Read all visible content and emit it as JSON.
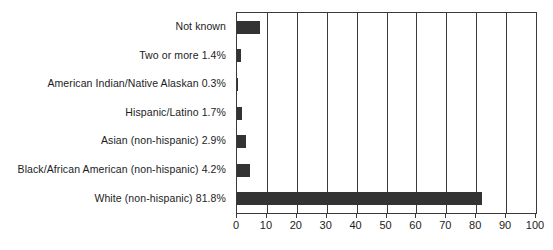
{
  "chart_data": {
    "type": "bar",
    "orientation": "horizontal",
    "title": "",
    "subtitle": "",
    "xlabel": "",
    "ylabel": "",
    "xlim": [
      0,
      100
    ],
    "xticks": [
      0,
      10,
      20,
      30,
      40,
      50,
      60,
      70,
      80,
      90,
      100
    ],
    "xtick_labels": [
      "0",
      "10",
      "20",
      "30",
      "40",
      "50",
      "60",
      "70",
      "80",
      "90",
      "100"
    ],
    "grid": true,
    "grid_axis": "x",
    "legend": false,
    "legend_position": "none",
    "bar_color": "#333333",
    "axis_color": "#3a3a3a",
    "categories": [
      "Not known",
      "Two or more 1.4%",
      "American Indian/Native Alaskan 0.3%",
      "Hispanic/Latino 1.7%",
      "Asian (non-hispanic) 2.9%",
      "Black/African American (non-hispanic) 4.2%",
      "White (non-hispanic) 81.8%"
    ],
    "values": [
      7.7,
      1.4,
      0.3,
      1.7,
      2.9,
      4.2,
      81.8
    ],
    "bars": [
      {
        "label": "Not known",
        "value": 7.7,
        "value_text": ""
      },
      {
        "label": "Two or more 1.4%",
        "value": 1.4,
        "value_text": "1.4%"
      },
      {
        "label": "American Indian/Native Alaskan 0.3%",
        "value": 0.3,
        "value_text": "0.3%"
      },
      {
        "label": "Hispanic/Latino 1.7%",
        "value": 1.7,
        "value_text": "1.7%"
      },
      {
        "label": "Asian (non-hispanic) 2.9%",
        "value": 2.9,
        "value_text": "2.9%"
      },
      {
        "label": "Black/African American (non-hispanic) 4.2%",
        "value": 4.2,
        "value_text": "4.2%"
      },
      {
        "label": "White (non-hispanic) 81.8%",
        "value": 81.8,
        "value_text": "81.8%"
      }
    ]
  }
}
